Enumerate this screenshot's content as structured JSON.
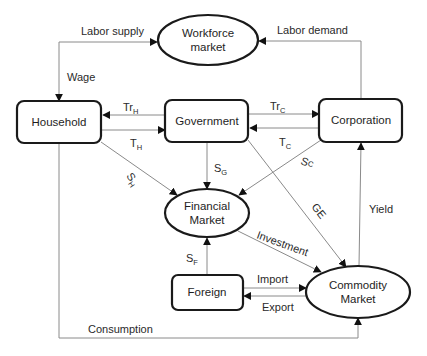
{
  "nodes": {
    "workforce": {
      "line1": "Workforce",
      "line2": "market",
      "shape": "ellipse"
    },
    "household": {
      "label": "Household",
      "shape": "rounded-rect"
    },
    "government": {
      "label": "Government",
      "shape": "rounded-rect"
    },
    "corporation": {
      "label": "Corporation",
      "shape": "rounded-rect"
    },
    "financial": {
      "line1": "Financial",
      "line2": "Market",
      "shape": "ellipse"
    },
    "foreign": {
      "label": "Foreign",
      "shape": "rounded-rect"
    },
    "commodity": {
      "line1": "Commodity",
      "line2": "Market",
      "shape": "ellipse"
    }
  },
  "edges": {
    "labor_supply": {
      "label": "Labor supply",
      "from": "household",
      "to": "workforce"
    },
    "wage": {
      "label": "Wage",
      "from": "workforce",
      "to": "household"
    },
    "labor_demand": {
      "label": "Labor demand",
      "from": "corporation",
      "to": "workforce"
    },
    "tr_h": {
      "main": "Tr",
      "sub": "H",
      "from": "government",
      "to": "household"
    },
    "t_h": {
      "main": "T",
      "sub": "H",
      "from": "household",
      "to": "government"
    },
    "tr_c": {
      "main": "Tr",
      "sub": "C",
      "from": "government",
      "to": "corporation"
    },
    "t_c": {
      "main": "T",
      "sub": "C",
      "from": "corporation",
      "to": "government"
    },
    "s_h": {
      "main": "S",
      "sub": "H",
      "from": "household",
      "to": "financial"
    },
    "s_g": {
      "main": "S",
      "sub": "G",
      "from": "government",
      "to": "financial"
    },
    "s_c": {
      "main": "S",
      "sub": "C",
      "from": "corporation",
      "to": "financial"
    },
    "ge": {
      "label": "GE",
      "from": "government",
      "to": "commodity"
    },
    "yield": {
      "label": "Yield",
      "from": "commodity",
      "to": "corporation"
    },
    "investment": {
      "label": "Investment",
      "from": "financial",
      "to": "commodity"
    },
    "s_f": {
      "main": "S",
      "sub": "F",
      "from": "foreign",
      "to": "financial"
    },
    "import": {
      "label": "Import",
      "from": "foreign",
      "to": "commodity"
    },
    "export": {
      "label": "Export",
      "from": "commodity",
      "to": "foreign"
    },
    "consumption": {
      "label": "Consumption",
      "from": "household",
      "to": "commodity"
    }
  },
  "colors": {
    "node_stroke": "#1a1a1a",
    "edge_stroke": "#8a8a8a",
    "text": "#2a2a2a",
    "background": "#ffffff"
  }
}
